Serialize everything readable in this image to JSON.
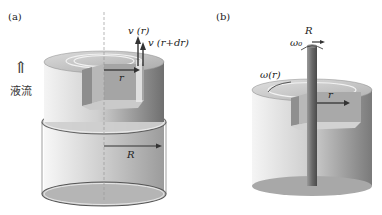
{
  "panels": [
    {
      "id": "a",
      "tag": "(a)",
      "labels": {
        "velocity_inner": "v (r)",
        "velocity_outer": "v (r+dr)",
        "inner_radius": "r",
        "outer_radius": "R",
        "flow_label": "液流",
        "flow_arrow": "⇑"
      }
    },
    {
      "id": "b",
      "tag": "(b)",
      "labels": {
        "rod_radius": "R",
        "rod_angular_velocity": "ω₀",
        "fluid_angular_velocity": "ω(r)",
        "radius": "r"
      }
    }
  ],
  "colors": {
    "ink": "#222222",
    "cylinder_light": "#f2f2f2",
    "cylinder_mid": "#bdbdbd",
    "cylinder_dark": "#7a7a7a",
    "top_face": "#cfcfcf",
    "rod": "#6e6e6e"
  }
}
